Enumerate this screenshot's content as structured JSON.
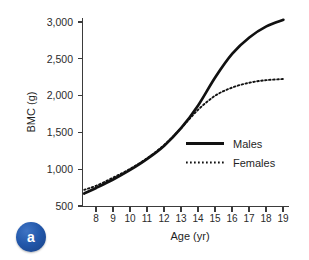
{
  "figure": {
    "panel_label": "a",
    "panel_badge_color": "#2257aa",
    "background_color": "#ffffff",
    "line_color": "#111111"
  },
  "chart_data": {
    "type": "line",
    "title": "",
    "xlabel": "Age (yr)",
    "ylabel": "BMC (g)",
    "xlim": [
      7.2,
      19.3
    ],
    "ylim": [
      500,
      3150
    ],
    "xticks": [
      8,
      9,
      10,
      11,
      12,
      13,
      14,
      15,
      16,
      17,
      18,
      19
    ],
    "xtick_labels": [
      "8",
      "9",
      "10",
      "11",
      "12",
      "13",
      "14",
      "15",
      "16",
      "17",
      "18",
      "19"
    ],
    "yticks": [
      500,
      1000,
      1500,
      2000,
      2500,
      3000
    ],
    "ytick_labels": [
      "500",
      "1,000",
      "1,500",
      "2,000",
      "2,500",
      "3,000"
    ],
    "grid": false,
    "legend_position": "center-right",
    "x": [
      7.3,
      8,
      9,
      10,
      11,
      12,
      13,
      14,
      15,
      16,
      17,
      18,
      19
    ],
    "series": [
      {
        "name": "Males",
        "label": "Males",
        "style": "solid",
        "values": [
          670,
          745,
          860,
          990,
          1140,
          1320,
          1560,
          1870,
          2250,
          2570,
          2790,
          2940,
          3030
        ]
      },
      {
        "name": "Females",
        "label": "Females",
        "style": "dotted",
        "values": [
          720,
          775,
          885,
          1005,
          1150,
          1330,
          1560,
          1810,
          2000,
          2110,
          2175,
          2210,
          2225
        ]
      }
    ]
  },
  "legend": {
    "items": [
      {
        "label": "Males",
        "style": "solid"
      },
      {
        "label": "Females",
        "style": "dotted"
      }
    ]
  }
}
